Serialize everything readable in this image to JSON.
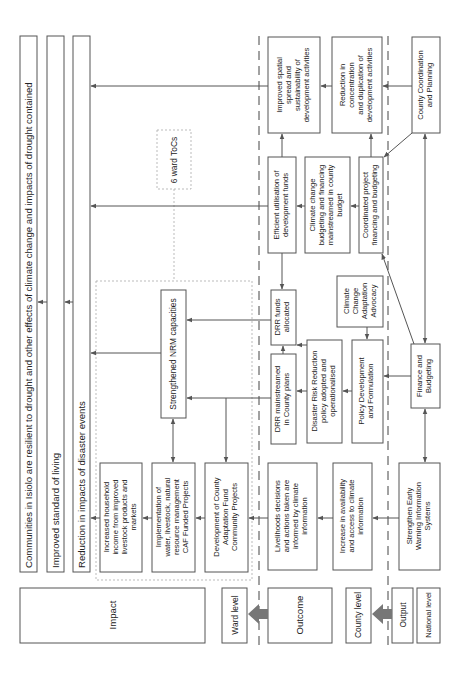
{
  "diagram": {
    "orientation": "rotated-90-ccw",
    "impact": {
      "goal": "Communities in Isiolo are resilient to drought and other effects of climate change and impacts of drought contained",
      "standard_of_living": "Improved standard of living",
      "disaster_reduction": "Reduction in impacts of disaster events"
    },
    "ward_tocs": "6 ward ToCs",
    "ward": {
      "nrm": "Strengthened NRM capacities",
      "household_income": [
        "Increased household",
        "income from improved",
        "livestock products and",
        "markets"
      ],
      "implementation": [
        "Implementation of",
        "water, livestock, natural",
        "resource management",
        "CAF Funded Projects"
      ],
      "development": [
        "Development of County",
        "Adaptation Fund",
        "Community Projects"
      ]
    },
    "outcome": {
      "spatial_spread": [
        "Improved spatial",
        "spread and",
        "sustainability of",
        "development activities"
      ],
      "efficient_funds": [
        "Efficient utilisation of",
        "development funds"
      ],
      "drr_funds": [
        "DRR funds",
        "allocated"
      ],
      "drr_mainstreamed": [
        "DRR mainstreamed",
        "in County plans"
      ],
      "livelihoods": [
        "Livelihoods decisions",
        "and actions taken are",
        "informed by climate",
        "information"
      ]
    },
    "county_output": {
      "concentration": [
        "Reduction in",
        "concentration",
        "and duplication of",
        "development activities"
      ],
      "cc_budgeting": [
        "Climate change",
        "budgeting and financing",
        "mainstreamed in county",
        "budget"
      ],
      "coordinated": [
        "Coordinated project",
        "financing and budgeting"
      ],
      "advocacy": [
        "Climate",
        "Change",
        "Adaptation",
        "Advocacy"
      ],
      "drr_policy": [
        "Disaster Risk Reduction",
        "policy adopted and",
        "operationalised"
      ],
      "policy_dev": [
        "Policy Development",
        "and Formulation"
      ],
      "climate_info": [
        "Increase in availability",
        "and access to climate",
        "information"
      ]
    },
    "national": {
      "coordination": [
        "County Coordination",
        "and Planning"
      ],
      "finance": [
        "Finance and",
        "Budgeting"
      ],
      "early_warning": [
        "Strengthen Early",
        "Warning Information",
        "Systems"
      ]
    },
    "legend": {
      "impact": "Impact",
      "ward_level": "Ward level",
      "outcome": "Outcome",
      "county_level": "County level",
      "output": "Output",
      "national_level": "National level"
    },
    "colors": {
      "stroke": "#555555",
      "text": "#222222",
      "dotted": "#aaaaaa",
      "big_arrow": "#777777"
    }
  }
}
